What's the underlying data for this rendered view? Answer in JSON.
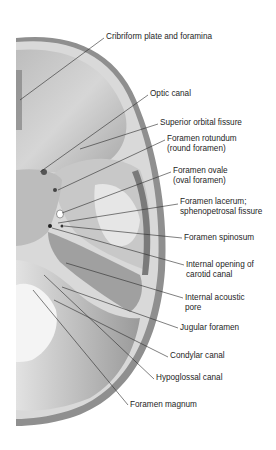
{
  "figure": {
    "labels": [
      {
        "id": "cribriform",
        "lines": [
          "Cribriform plate and foramina"
        ],
        "x": 106,
        "y": 32,
        "target": [
          20,
          100
        ],
        "anchor": [
          104,
          38
        ]
      },
      {
        "id": "optic",
        "lines": [
          "Optic canal"
        ],
        "x": 150,
        "y": 89,
        "target": [
          40,
          172
        ],
        "anchor": [
          148,
          95
        ]
      },
      {
        "id": "sup-orbital",
        "lines": [
          "Superior orbital fissure"
        ],
        "x": 160,
        "y": 118,
        "target": [
          80,
          149
        ],
        "anchor": [
          158,
          124
        ]
      },
      {
        "id": "rotundum",
        "lines": [
          "Foramen rotundum",
          "(round foramen)"
        ],
        "x": 167,
        "y": 134,
        "target": [
          58,
          190
        ],
        "anchor": [
          165,
          140
        ]
      },
      {
        "id": "ovale",
        "lines": [
          "Foramen ovale",
          "(oval foramen)"
        ],
        "x": 173,
        "y": 166,
        "target": [
          62,
          213
        ],
        "anchor": [
          171,
          172
        ]
      },
      {
        "id": "lacerum",
        "lines": [
          "Foramen lacerum;",
          "sphenopetrosal fissure"
        ],
        "x": 180,
        "y": 197,
        "target": [
          58,
          223
        ],
        "anchor": [
          178,
          204
        ]
      },
      {
        "id": "spinosum",
        "lines": [
          "Foramen spinosum"
        ],
        "x": 184,
        "y": 233,
        "target": [
          64,
          226
        ],
        "anchor": [
          182,
          238
        ]
      },
      {
        "id": "carotid",
        "lines": [
          "Internal opening of",
          "carotid canal"
        ],
        "x": 186,
        "y": 260,
        "target": [
          52,
          228
        ],
        "anchor": [
          184,
          265
        ]
      },
      {
        "id": "acoustic",
        "lines": [
          "Internal acoustic",
          "pore"
        ],
        "x": 185,
        "y": 293,
        "target": [
          66,
          263
        ],
        "anchor": [
          183,
          298
        ]
      },
      {
        "id": "jugular",
        "lines": [
          "Jugular foramen"
        ],
        "x": 180,
        "y": 323,
        "target": [
          62,
          287
        ],
        "anchor": [
          178,
          328
        ]
      },
      {
        "id": "condylar",
        "lines": [
          "Condylar canal"
        ],
        "x": 170,
        "y": 351,
        "target": [
          54,
          300
        ],
        "anchor": [
          168,
          357
        ]
      },
      {
        "id": "hypoglossal",
        "lines": [
          "Hypoglossal canal"
        ],
        "x": 156,
        "y": 373,
        "target": [
          44,
          275
        ],
        "anchor": [
          154,
          379
        ]
      },
      {
        "id": "magnum",
        "lines": [
          "Foramen magnum"
        ],
        "x": 130,
        "y": 400,
        "target": [
          33,
          290
        ],
        "anchor": [
          128,
          405
        ]
      }
    ]
  }
}
